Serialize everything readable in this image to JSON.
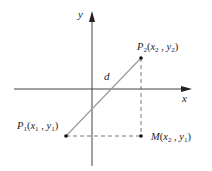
{
  "diagram": {
    "axes": {
      "x_label": "x",
      "y_label": "y"
    },
    "points": [
      {
        "id": "P1",
        "name": "P",
        "sub": "1",
        "coords": "(x₁ , y₁)",
        "x1": "x",
        "x1sub": "1",
        "y1": "y",
        "y1sub": "1"
      },
      {
        "id": "P2",
        "name": "P",
        "sub": "2",
        "x1": "x",
        "x1sub": "2",
        "y1": "y",
        "y1sub": "2"
      },
      {
        "id": "M",
        "name": "M",
        "x1": "x",
        "x1sub": "2",
        "y1": "y",
        "y1sub": "1"
      }
    ],
    "segment_label": "d",
    "colors": {
      "axis": "#333333",
      "segment": "#999999",
      "dashed": "#777777",
      "point": "#111111"
    }
  }
}
